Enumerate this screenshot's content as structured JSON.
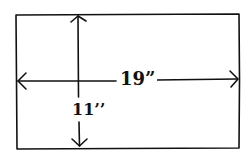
{
  "diagram": {
    "shape": "rectangle",
    "stroke_color": "#111111",
    "background": "#ffffff",
    "dimensions": {
      "width_label": "19”",
      "height_label": "11’’"
    }
  }
}
